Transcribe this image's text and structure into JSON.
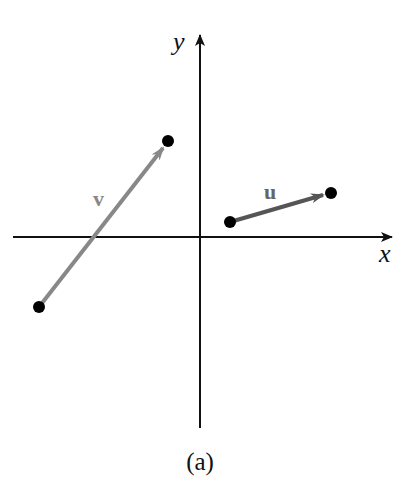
{
  "figure": {
    "caption": "(a)",
    "axes": {
      "x_label": "x",
      "y_label": "y",
      "origin": [
        200,
        237
      ],
      "x_axis": {
        "from": [
          13,
          237
        ],
        "to": [
          392,
          237
        ]
      },
      "y_axis": {
        "from": [
          200,
          428
        ],
        "to": [
          200,
          35
        ]
      },
      "color": "#111111"
    },
    "vectors": [
      {
        "name": "v",
        "label": "v",
        "tail": [
          39,
          307
        ],
        "head": [
          168,
          141
        ],
        "color": "#888888",
        "label_pos": [
          100,
          204
        ]
      },
      {
        "name": "u",
        "label": "u",
        "tail": [
          230,
          222
        ],
        "head": [
          330,
          193
        ],
        "color": "#555555",
        "label_pos": [
          273,
          199
        ]
      }
    ],
    "point_color": "#000000"
  }
}
